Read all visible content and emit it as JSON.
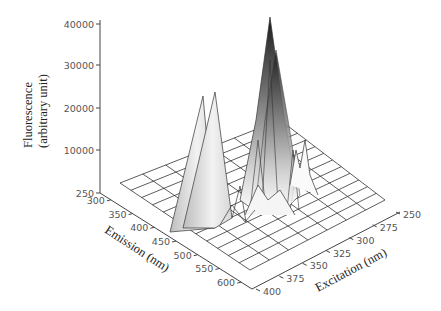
{
  "chart_data": {
    "type": "surface3d",
    "title": "",
    "zlabel_line1": "Fluorescence",
    "zlabel_line2": "(arbitrary unit)",
    "xlabel": "Emission (nm)",
    "ylabel": "Excitation (nm)",
    "z_ticks": [
      "40000",
      "30000",
      "20000",
      "10000",
      "250"
    ],
    "z_tick_values": [
      40000,
      30000,
      20000,
      10000,
      250
    ],
    "emission_ticks": [
      "300",
      "350",
      "400",
      "450",
      "500",
      "550",
      "600"
    ],
    "excitation_ticks": [
      "250",
      "275",
      "300",
      "325",
      "350",
      "375",
      "400"
    ],
    "zlim": [
      250,
      40000
    ],
    "emission_range": [
      275,
      625
    ],
    "excitation_range": [
      250,
      400
    ],
    "grid": true,
    "peaks": [
      {
        "name": "main-peak",
        "emission_nm": 350,
        "excitation_nm": 280,
        "fluorescence": 38000
      },
      {
        "name": "secondary-peak",
        "emission_nm": 340,
        "excitation_nm": 290,
        "fluorescence": 30000
      },
      {
        "name": "scatter-ridge",
        "emission_nm": 420,
        "excitation_nm": 375,
        "fluorescence": 12000
      },
      {
        "name": "minor-peak",
        "emission_nm": 330,
        "excitation_nm": 260,
        "fluorescence": 6000
      }
    ]
  }
}
